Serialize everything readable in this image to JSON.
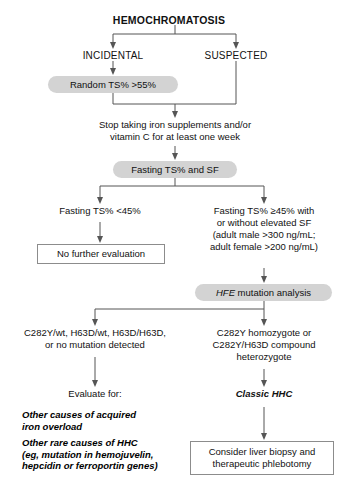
{
  "diagram": {
    "title": "HEMOCHROMATOSIS",
    "branches": {
      "incidental": "INCIDENTAL",
      "suspected": "SUSPECTED"
    },
    "nodes": {
      "random_ts": "Random TS% >55%",
      "stop_iron_line1": "Stop taking iron supplements and/or",
      "stop_iron_line2": "vitamin C for at least one week",
      "fasting_panel": "Fasting TS% and SF",
      "fasting_low": "Fasting TS% <45%",
      "no_further_eval": "No further evaluation",
      "fasting_high_line1": "Fasting TS% ≥45% with",
      "fasting_high_line2": "or without elevated SF",
      "fasting_high_line3": "(adult male >300 ng/mL;",
      "fasting_high_line4": "adult female >200 ng/mL)",
      "hfe_gene": "HFE",
      "hfe_rest": " mutation analysis",
      "genotype_neg_line1": "C282Y/wt, H63D/wt, H63D/H63D,",
      "genotype_neg_line2": "or no mutation detected",
      "genotype_pos_line1": "C282Y homozygote or",
      "genotype_pos_line2": "C282Y/H63D compound",
      "genotype_pos_line3": "heterozygote",
      "evaluate_for": "Evaluate for:",
      "classic_hhc": "Classic HHC",
      "other_acquired_line1": "Other causes of acquired",
      "other_acquired_line2": "iron overload",
      "other_rare_line1": "Other rare causes of HHC",
      "other_rare_line2": "(eg, mutation in hemojuvelin,",
      "other_rare_line3": "hepcidin or ferroportin genes)",
      "consider_biopsy_line1": "Consider liver biopsy and",
      "consider_biopsy_line2": "therapeutic phlebotomy"
    },
    "colors": {
      "pill_fill": "#d3d3d3",
      "connector": "#555555",
      "box_border": "#8c8c8c",
      "background": "#ffffff",
      "text": "#111111"
    }
  }
}
